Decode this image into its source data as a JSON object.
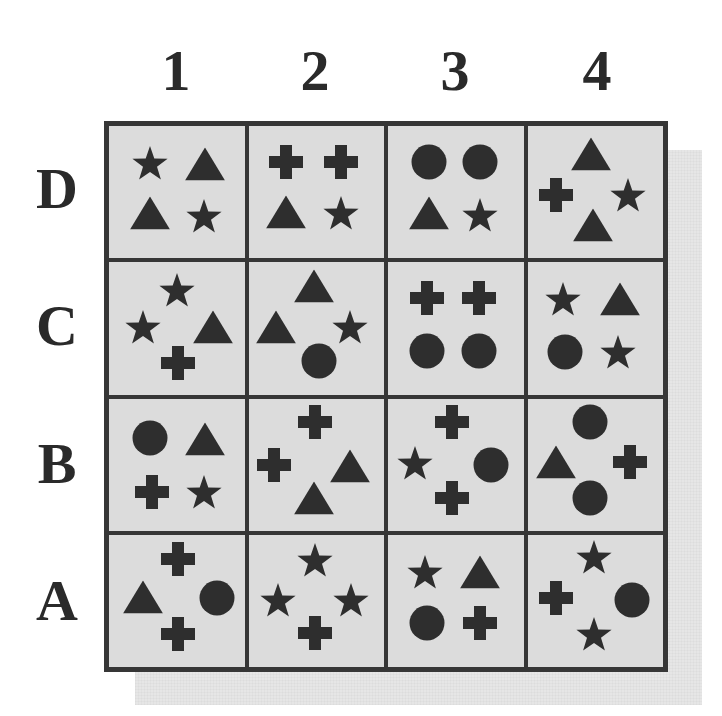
{
  "columns": [
    "1",
    "2",
    "3",
    "4"
  ],
  "rows": [
    "D",
    "C",
    "B",
    "A"
  ],
  "colors": {
    "shape": "#2e2e2e",
    "grid_line": "#363636",
    "cell_bg": "#dcdcdc",
    "label": "#2a2a2a",
    "shadow": "#e6e6e6"
  },
  "grid": {
    "D": [
      [
        {
          "shape": "star",
          "x": 30,
          "y": 28
        },
        {
          "shape": "triangle",
          "x": 71,
          "y": 29
        },
        {
          "shape": "triangle",
          "x": 30,
          "y": 66
        },
        {
          "shape": "star",
          "x": 70,
          "y": 68
        }
      ],
      [
        {
          "shape": "cross",
          "x": 28,
          "y": 27
        },
        {
          "shape": "cross",
          "x": 68,
          "y": 27
        },
        {
          "shape": "triangle",
          "x": 28,
          "y": 65
        },
        {
          "shape": "star",
          "x": 68,
          "y": 66
        }
      ],
      [
        {
          "shape": "circle",
          "x": 30,
          "y": 27
        },
        {
          "shape": "circle",
          "x": 68,
          "y": 27
        },
        {
          "shape": "triangle",
          "x": 30,
          "y": 66
        },
        {
          "shape": "star",
          "x": 68,
          "y": 67
        }
      ],
      [
        {
          "shape": "triangle",
          "x": 47,
          "y": 21
        },
        {
          "shape": "cross",
          "x": 21,
          "y": 52
        },
        {
          "shape": "star",
          "x": 74,
          "y": 52
        },
        {
          "shape": "triangle",
          "x": 48,
          "y": 75
        }
      ]
    ],
    "C": [
      [
        {
          "shape": "star",
          "x": 50,
          "y": 21
        },
        {
          "shape": "star",
          "x": 25,
          "y": 49
        },
        {
          "shape": "triangle",
          "x": 77,
          "y": 49
        },
        {
          "shape": "cross",
          "x": 51,
          "y": 76
        }
      ],
      [
        {
          "shape": "triangle",
          "x": 48,
          "y": 18
        },
        {
          "shape": "triangle",
          "x": 20,
          "y": 49
        },
        {
          "shape": "star",
          "x": 75,
          "y": 49
        },
        {
          "shape": "circle",
          "x": 52,
          "y": 75
        }
      ],
      [
        {
          "shape": "cross",
          "x": 29,
          "y": 27
        },
        {
          "shape": "cross",
          "x": 67,
          "y": 27
        },
        {
          "shape": "circle",
          "x": 29,
          "y": 67
        },
        {
          "shape": "circle",
          "x": 67,
          "y": 67
        }
      ],
      [
        {
          "shape": "star",
          "x": 26,
          "y": 28
        },
        {
          "shape": "triangle",
          "x": 68,
          "y": 28
        },
        {
          "shape": "circle",
          "x": 28,
          "y": 68
        },
        {
          "shape": "star",
          "x": 67,
          "y": 68
        }
      ]
    ],
    "B": [
      [
        {
          "shape": "circle",
          "x": 30,
          "y": 30
        },
        {
          "shape": "triangle",
          "x": 71,
          "y": 31
        },
        {
          "shape": "cross",
          "x": 32,
          "y": 71
        },
        {
          "shape": "star",
          "x": 70,
          "y": 71
        }
      ],
      [
        {
          "shape": "cross",
          "x": 49,
          "y": 18
        },
        {
          "shape": "cross",
          "x": 19,
          "y": 50
        },
        {
          "shape": "triangle",
          "x": 75,
          "y": 51
        },
        {
          "shape": "triangle",
          "x": 48,
          "y": 75
        }
      ],
      [
        {
          "shape": "cross",
          "x": 47,
          "y": 18
        },
        {
          "shape": "star",
          "x": 20,
          "y": 49
        },
        {
          "shape": "circle",
          "x": 76,
          "y": 50
        },
        {
          "shape": "cross",
          "x": 47,
          "y": 75
        }
      ],
      [
        {
          "shape": "circle",
          "x": 46,
          "y": 18
        },
        {
          "shape": "triangle",
          "x": 21,
          "y": 48
        },
        {
          "shape": "cross",
          "x": 76,
          "y": 48
        },
        {
          "shape": "circle",
          "x": 46,
          "y": 75
        }
      ]
    ],
    "A": [
      [
        {
          "shape": "cross",
          "x": 51,
          "y": 18
        },
        {
          "shape": "triangle",
          "x": 25,
          "y": 47
        },
        {
          "shape": "circle",
          "x": 80,
          "y": 48
        },
        {
          "shape": "cross",
          "x": 51,
          "y": 75
        }
      ],
      [
        {
          "shape": "star",
          "x": 49,
          "y": 19
        },
        {
          "shape": "star",
          "x": 22,
          "y": 49
        },
        {
          "shape": "star",
          "x": 76,
          "y": 49
        },
        {
          "shape": "cross",
          "x": 49,
          "y": 74
        }
      ],
      [
        {
          "shape": "star",
          "x": 27,
          "y": 28
        },
        {
          "shape": "triangle",
          "x": 68,
          "y": 28
        },
        {
          "shape": "circle",
          "x": 29,
          "y": 67
        },
        {
          "shape": "cross",
          "x": 68,
          "y": 67
        }
      ],
      [
        {
          "shape": "star",
          "x": 49,
          "y": 17
        },
        {
          "shape": "cross",
          "x": 21,
          "y": 48
        },
        {
          "shape": "circle",
          "x": 77,
          "y": 49
        },
        {
          "shape": "star",
          "x": 49,
          "y": 75
        }
      ]
    ]
  }
}
